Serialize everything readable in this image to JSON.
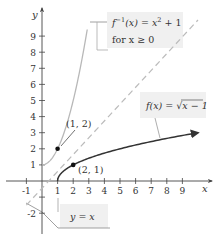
{
  "chart_data": {
    "type": "line",
    "title": "",
    "xlabel": "x",
    "ylabel": "y",
    "xlim": [
      -1.5,
      10
    ],
    "ylim": [
      -2.5,
      10
    ],
    "x_ticks": [
      "-1",
      "1",
      "2",
      "3",
      "4",
      "5",
      "6",
      "7",
      "8",
      "9"
    ],
    "y_ticks": [
      "-2",
      "1",
      "2",
      "3",
      "4",
      "5",
      "6",
      "7",
      "8",
      "9"
    ],
    "grid": false,
    "series": [
      {
        "name": "f(x) = √(x − 1)",
        "style": "solid dark with arrow",
        "color": "#333333",
        "x": [
          1,
          1.25,
          2,
          3,
          5,
          7,
          10
        ],
        "y": [
          0,
          0.5,
          1,
          1.414,
          2,
          2.449,
          3
        ]
      },
      {
        "name": "f⁻¹(x) = x² + 1 for x ≥ 0",
        "style": "solid light gray",
        "color": "#b8b8b8",
        "x": [
          0,
          0.5,
          1,
          1.5,
          2,
          2.5,
          2.9
        ],
        "y": [
          1,
          1.25,
          2,
          3.25,
          5,
          7.25,
          9.41
        ]
      },
      {
        "name": "y = x",
        "style": "dashed",
        "color": "#bbbbbb",
        "x": [
          -1.5,
          10
        ],
        "y": [
          -1.5,
          10
        ]
      }
    ],
    "points": [
      {
        "label": "(1, 2)",
        "x": 1,
        "y": 2
      },
      {
        "label": "(2, 1)",
        "x": 2,
        "y": 1
      }
    ],
    "annotations": [
      {
        "text": "f(x) = √x − 1",
        "target": "f"
      },
      {
        "text_line1": "f⁻¹(x) = x² + 1",
        "text_line2": "for x ≥ 0",
        "target": "finv"
      },
      {
        "text": "y = x",
        "target": "identity"
      }
    ]
  },
  "labels": {
    "x_axis": "x",
    "y_axis": "y",
    "point_a": "(1, 2)",
    "point_b": "(2, 1)",
    "f_prefix": "f(x) = ",
    "f_radicand": "x − 1",
    "finv_f": "f",
    "finv_sup": "−1",
    "finv_rest": "(x) = x",
    "finv_sq": "2",
    "finv_plus": " + 1",
    "finv_cond": "for x ≥ 0",
    "identity": "y = x"
  },
  "ticks": {
    "x": [
      {
        "v": -1,
        "t": "-1"
      },
      {
        "v": 1,
        "t": "1"
      },
      {
        "v": 2,
        "t": "2"
      },
      {
        "v": 3,
        "t": "3"
      },
      {
        "v": 4,
        "t": "4"
      },
      {
        "v": 5,
        "t": "5"
      },
      {
        "v": 6,
        "t": "6"
      },
      {
        "v": 7,
        "t": "7"
      },
      {
        "v": 8,
        "t": "8"
      },
      {
        "v": 9,
        "t": "9"
      }
    ],
    "y": [
      {
        "v": -2,
        "t": "-2"
      },
      {
        "v": -1,
        "t": ""
      },
      {
        "v": 1,
        "t": "1"
      },
      {
        "v": 2,
        "t": "2"
      },
      {
        "v": 3,
        "t": "3"
      },
      {
        "v": 4,
        "t": "4"
      },
      {
        "v": 5,
        "t": "5"
      },
      {
        "v": 6,
        "t": "6"
      },
      {
        "v": 7,
        "t": "7"
      },
      {
        "v": 8,
        "t": "8"
      },
      {
        "v": 9,
        "t": "9"
      }
    ]
  }
}
